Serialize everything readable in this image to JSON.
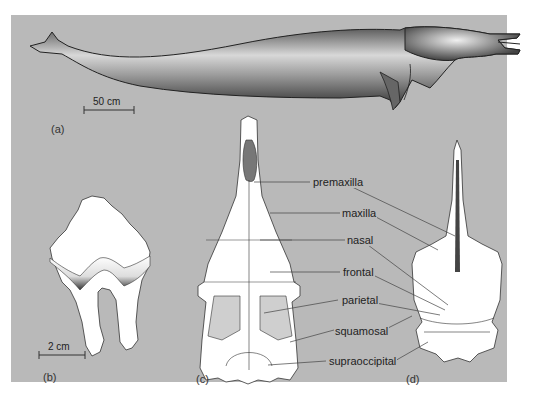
{
  "figure": {
    "panels": [
      {
        "id": "a",
        "label": "(a)",
        "subject": "whole-body lateral view",
        "scale_bar": "50 cm"
      },
      {
        "id": "b",
        "label": "(b)",
        "subject": "tooth",
        "scale_bar": "2 cm"
      },
      {
        "id": "c",
        "label": "(c)",
        "subject": "skull dorsal view"
      },
      {
        "id": "d",
        "label": "(d)",
        "subject": "skull dorsal view"
      }
    ],
    "labels": {
      "premaxilla": "premaxilla",
      "maxilla": "maxilla",
      "nasal": "nasal",
      "frontal": "frontal",
      "parietal": "parietal",
      "squamosal": "squamosal",
      "supraoccipital": "supraoccipital"
    },
    "colors": {
      "background": "#b9b9b9",
      "bone": "#ffffff",
      "outline": "#333333",
      "stipple": "#4a4a4a"
    }
  }
}
